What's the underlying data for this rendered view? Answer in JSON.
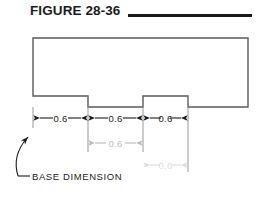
{
  "figure": {
    "title": "FIGURE 28-36",
    "rule": true
  },
  "drawing": {
    "part_name": "stepped-block-outline",
    "outline_color": "#5a5a5a",
    "dimension_color": "#1b1b1b",
    "ghost_color_1": "#b9b9b9",
    "ghost_color_2": "#dcdcdc"
  },
  "dimensions": {
    "row1": [
      {
        "value": "0.6",
        "tone": "solid"
      },
      {
        "value": "0.6",
        "tone": "solid"
      },
      {
        "value": "0.6",
        "tone": "solid"
      }
    ],
    "row2": [
      {
        "value": "0.6",
        "tone": "ghost"
      }
    ],
    "row3": [
      {
        "value": "0.6",
        "tone": "faint"
      }
    ]
  },
  "annotation": {
    "label": "BASE  DIMENSION",
    "leader": "curved-leader-arrow"
  }
}
